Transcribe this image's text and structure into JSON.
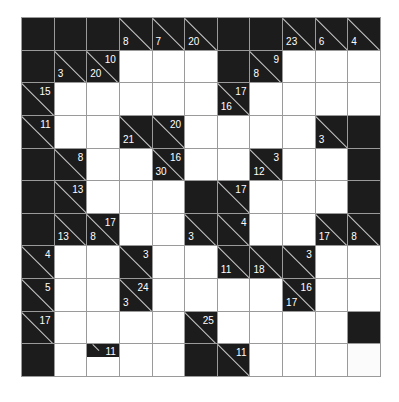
{
  "puzzle": {
    "type": "kakuro",
    "rows": 11,
    "cols": 11,
    "legend": {
      "B": "blocked",
      "W": "white entry cell",
      "C": "clue cell (r = across sum, d = down sum)"
    },
    "cells": [
      [
        {
          "t": "B"
        },
        {
          "t": "B"
        },
        {
          "t": "B"
        },
        {
          "t": "C",
          "d": "8"
        },
        {
          "t": "C",
          "d": "7"
        },
        {
          "t": "C",
          "d": "20"
        },
        {
          "t": "B"
        },
        {
          "t": "B"
        },
        {
          "t": "C",
          "d": "23"
        },
        {
          "t": "C",
          "d": "6"
        },
        {
          "t": "C",
          "d": "4"
        }
      ],
      [
        {
          "t": "B"
        },
        {
          "t": "C",
          "d": "3"
        },
        {
          "t": "C",
          "r": "10",
          "d": "20"
        },
        {
          "t": "W"
        },
        {
          "t": "W"
        },
        {
          "t": "W"
        },
        {
          "t": "B"
        },
        {
          "t": "C",
          "r": "9",
          "d": "8"
        },
        {
          "t": "W"
        },
        {
          "t": "W"
        },
        {
          "t": "W"
        }
      ],
      [
        {
          "t": "C",
          "r": "15"
        },
        {
          "t": "W"
        },
        {
          "t": "W"
        },
        {
          "t": "W"
        },
        {
          "t": "W"
        },
        {
          "t": "W"
        },
        {
          "t": "C",
          "r": "17",
          "d": "16"
        },
        {
          "t": "W"
        },
        {
          "t": "W"
        },
        {
          "t": "W"
        },
        {
          "t": "W"
        }
      ],
      [
        {
          "t": "C",
          "r": "11"
        },
        {
          "t": "W"
        },
        {
          "t": "W"
        },
        {
          "t": "C",
          "d": "21"
        },
        {
          "t": "C",
          "r": "20"
        },
        {
          "t": "W"
        },
        {
          "t": "W"
        },
        {
          "t": "W"
        },
        {
          "t": "W"
        },
        {
          "t": "C",
          "d": "3"
        },
        {
          "t": "B"
        }
      ],
      [
        {
          "t": "B"
        },
        {
          "t": "C",
          "r": "8"
        },
        {
          "t": "W"
        },
        {
          "t": "W"
        },
        {
          "t": "C",
          "r": "16",
          "d": "30"
        },
        {
          "t": "W"
        },
        {
          "t": "W"
        },
        {
          "t": "C",
          "r": "3",
          "d": "12"
        },
        {
          "t": "W"
        },
        {
          "t": "W"
        },
        {
          "t": "B"
        }
      ],
      [
        {
          "t": "B"
        },
        {
          "t": "C",
          "r": "13"
        },
        {
          "t": "W"
        },
        {
          "t": "W"
        },
        {
          "t": "W"
        },
        {
          "t": "B"
        },
        {
          "t": "C",
          "r": "17"
        },
        {
          "t": "W"
        },
        {
          "t": "W"
        },
        {
          "t": "W"
        },
        {
          "t": "B"
        }
      ],
      [
        {
          "t": "B"
        },
        {
          "t": "C",
          "d": "13"
        },
        {
          "t": "C",
          "r": "17",
          "d": "8"
        },
        {
          "t": "W"
        },
        {
          "t": "W"
        },
        {
          "t": "C",
          "d": "3"
        },
        {
          "t": "C",
          "r": "4"
        },
        {
          "t": "W"
        },
        {
          "t": "W"
        },
        {
          "t": "C",
          "d": "17"
        },
        {
          "t": "C",
          "d": "8"
        }
      ],
      [
        {
          "t": "C",
          "r": "4"
        },
        {
          "t": "W"
        },
        {
          "t": "W"
        },
        {
          "t": "C",
          "r": "3"
        },
        {
          "t": "W"
        },
        {
          "t": "W"
        },
        {
          "t": "C",
          "d": "11"
        },
        {
          "t": "C",
          "d": "18"
        },
        {
          "t": "C",
          "r": "3"
        },
        {
          "t": "W"
        },
        {
          "t": "W"
        }
      ],
      [
        {
          "t": "C",
          "r": "5"
        },
        {
          "t": "W"
        },
        {
          "t": "W"
        },
        {
          "t": "C",
          "r": "24",
          "d": "3"
        },
        {
          "t": "W"
        },
        {
          "t": "W"
        },
        {
          "t": "W"
        },
        {
          "t": "W"
        },
        {
          "t": "C",
          "r": "16",
          "d": "17"
        },
        {
          "t": "W"
        },
        {
          "t": "W"
        }
      ],
      [
        {
          "t": "C",
          "r": "17"
        },
        {
          "t": "W"
        },
        {
          "t": "W"
        },
        {
          "t": "W"
        },
        {
          "t": "W"
        },
        {
          "t": "C",
          "r": "25"
        },
        {
          "t": "W"
        },
        {
          "t": "W"
        },
        {
          "t": "W"
        },
        {
          "t": "W"
        },
        {
          "t": "B"
        }
      ],
      [
        {
          "t": "B"
        },
        {
          "t": "W",
          "style": "bare"
        },
        {
          "t": "H",
          "r": "11"
        },
        {
          "t": "W"
        },
        {
          "t": "W"
        },
        {
          "t": "B"
        },
        {
          "t": "C",
          "r": "11"
        },
        {
          "t": "W"
        },
        {
          "t": "W"
        },
        {
          "t": "W"
        },
        {
          "t": "W",
          "style": "faint"
        }
      ]
    ]
  }
}
